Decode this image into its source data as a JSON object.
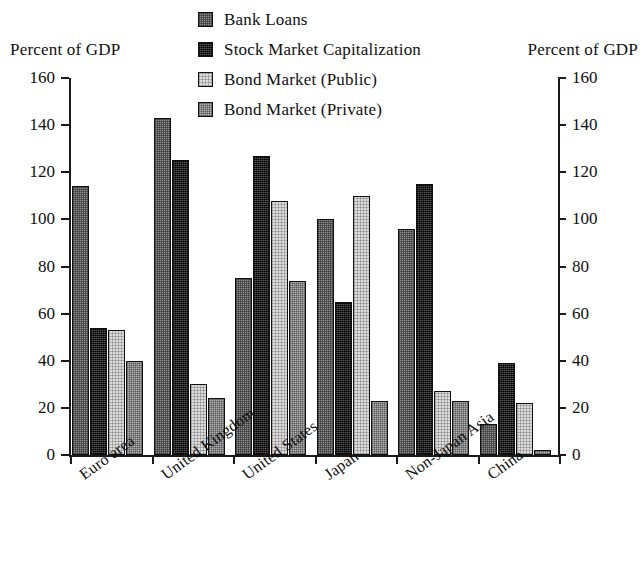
{
  "axis_titles": {
    "left": "Percent of GDP",
    "right": "Percent of GDP"
  },
  "legend": {
    "items": [
      {
        "label": "Bank Loans",
        "swatch": "medium-gray-dither",
        "color": "#8f8f8f"
      },
      {
        "label": "Stock Market Capitalization",
        "swatch": "dark-gray-dither",
        "color": "#2e2e2e"
      },
      {
        "label": "Bond Market (Public)",
        "swatch": "light-gray-dither",
        "color": "#dcdcdc"
      },
      {
        "label": "Bond Market (Private)",
        "swatch": "mid-light-gray-dither",
        "color": "#b4b4b4"
      }
    ]
  },
  "chart_data": {
    "type": "bar",
    "title": "",
    "xlabel": "",
    "ylabel": "Percent of GDP",
    "ylim": [
      0,
      160
    ],
    "yticks": [
      0,
      20,
      40,
      60,
      80,
      100,
      120,
      140,
      160
    ],
    "ytick_labels": [
      "0",
      "20",
      "40",
      "60",
      "80",
      "100",
      "120",
      "140",
      "160"
    ],
    "grid": false,
    "legend_position": "top-center",
    "dual_axis": true,
    "categories": [
      "Euro area",
      "United Kingdom",
      "United States",
      "Japan",
      "Non-Japan Asia",
      "China"
    ],
    "series": [
      {
        "name": "Bank Loans",
        "values": [
          114,
          143,
          75,
          100,
          96,
          13
        ]
      },
      {
        "name": "Stock Market Capitalization",
        "values": [
          54,
          125,
          127,
          65,
          115,
          39
        ]
      },
      {
        "name": "Bond Market (Public)",
        "values": [
          53,
          30,
          108,
          110,
          27,
          22
        ]
      },
      {
        "name": "Bond Market (Private)",
        "values": [
          40,
          24,
          74,
          23,
          23,
          2
        ]
      }
    ]
  }
}
